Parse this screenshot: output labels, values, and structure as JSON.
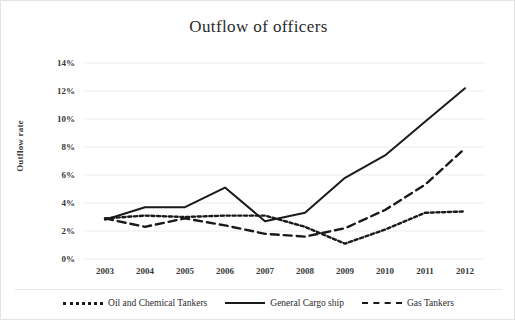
{
  "chart_data": {
    "type": "line",
    "title": "Outflow of officers",
    "xlabel": "",
    "ylabel": "Outflow rate",
    "categories": [
      "2003",
      "2004",
      "2005",
      "2006",
      "2007",
      "2008",
      "2009",
      "2010",
      "2011",
      "2012"
    ],
    "ylim": [
      0,
      14
    ],
    "y_ticks": [
      "0%",
      "2%",
      "4%",
      "6%",
      "8%",
      "10%",
      "12%",
      "14%"
    ],
    "y_tick_values": [
      0,
      2,
      4,
      6,
      8,
      10,
      12,
      14
    ],
    "y_unit": "%",
    "grid": true,
    "legend_position": "bottom",
    "series": [
      {
        "name": "Oil and Chemical Tankers",
        "style": "dotted",
        "color": "#1a1a1a",
        "values": [
          2.9,
          3.1,
          3.0,
          3.1,
          3.1,
          2.3,
          1.1,
          2.1,
          3.3,
          3.4
        ]
      },
      {
        "name": "General Cargo ship",
        "style": "solid",
        "color": "#1a1a1a",
        "values": [
          2.8,
          3.7,
          3.7,
          5.1,
          2.7,
          3.3,
          5.8,
          7.4,
          9.8,
          12.2
        ]
      },
      {
        "name": "Gas Tankers",
        "style": "dashed",
        "color": "#1a1a1a",
        "values": [
          2.9,
          2.3,
          2.9,
          2.4,
          1.8,
          1.6,
          2.2,
          3.5,
          5.3,
          7.9
        ]
      }
    ]
  },
  "legend": {
    "items": [
      {
        "label": "Oil and Chemical Tankers",
        "style": "dotted"
      },
      {
        "label": "General Cargo ship",
        "style": "solid"
      },
      {
        "label": "Gas Tankers",
        "style": "dashed"
      }
    ]
  }
}
